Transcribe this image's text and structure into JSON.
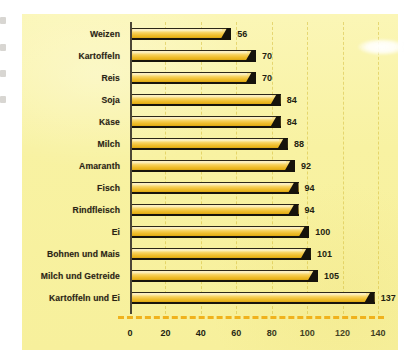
{
  "chart_data": {
    "type": "bar",
    "orientation": "horizontal",
    "title": "",
    "subtitle": "",
    "xlabel": "",
    "ylabel": "",
    "categories": [
      "Weizen",
      "Kartoffeln",
      "Reis",
      "Soja",
      "Käse",
      "Milch",
      "Amaranth",
      "Fisch",
      "Rindfleisch",
      "Ei",
      "Bohnen und Mais",
      "Milch und Getreide",
      "Kartoffeln und Ei"
    ],
    "values": [
      56,
      70,
      70,
      84,
      84,
      88,
      92,
      94,
      94,
      100,
      101,
      105,
      137
    ],
    "value_labels": [
      "56",
      "70",
      "70",
      "84",
      "84",
      "88",
      "92",
      "94",
      "94",
      "100",
      "101",
      "105",
      "137"
    ],
    "xlim": [
      0,
      140
    ],
    "xticks": [
      0,
      20,
      40,
      60,
      80,
      100,
      120,
      140
    ],
    "xtick_labels": [
      "0",
      "20",
      "40",
      "60",
      "80",
      "100",
      "120",
      "140"
    ],
    "grid": "vertical-dashed",
    "legend": "none",
    "series": [
      {
        "name": "Biologische Wertigkeit",
        "values": [
          56,
          70,
          70,
          84,
          84,
          88,
          92,
          94,
          94,
          100,
          101,
          105,
          137
        ]
      }
    ]
  },
  "style": {
    "panel_background": "#f9f3a8",
    "bar_fill_light": "#fbe9a0",
    "bar_fill_dark": "#e8b41c",
    "bar_edge": "#16130b",
    "axis_color": "#4b4636",
    "gridline_color": "#d6be3c",
    "baseline_rule_color": "#f0b21c",
    "text_color": "#231e11",
    "page_background": "#ffffff"
  },
  "decorations": {
    "highlight_blob": "white-ellipse-glare"
  }
}
